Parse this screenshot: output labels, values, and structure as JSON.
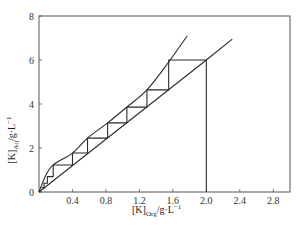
{
  "chart_data": {
    "type": "line",
    "title": "",
    "xlabel": "[K]Org/g·L⁻¹",
    "ylabel": "[K]Aq/g·L⁻¹",
    "xlabel_parts": {
      "main": "[K]",
      "sub": "Org",
      "unit": "/g·L",
      "sup": "−1"
    },
    "ylabel_parts": {
      "main": "[K]",
      "sub": "Aq",
      "unit": "/g·L",
      "sup": "−1"
    },
    "xlim": [
      0,
      3.0
    ],
    "ylim": [
      0,
      8
    ],
    "x_ticks": [
      0.4,
      0.8,
      1.2,
      1.6,
      2.0,
      2.4,
      2.8
    ],
    "x_tick_labels": [
      "0.4",
      "0.8",
      "1.2",
      "1.6",
      "2.0",
      "2.4",
      "2.8"
    ],
    "y_ticks": [
      0,
      2,
      4,
      6,
      8
    ],
    "y_tick_labels": [
      "0",
      "2",
      "4",
      "6",
      "8"
    ],
    "grid": false,
    "legend": null,
    "series": [
      {
        "name": "equilibrium-curve",
        "style": "curve",
        "x": [
          0.0,
          0.08,
          0.17,
          0.4,
          0.58,
          0.82,
          1.05,
          1.29,
          1.55,
          1.77
        ],
        "y": [
          0.0,
          0.75,
          1.23,
          1.77,
          2.45,
          3.14,
          3.86,
          4.64,
          5.91,
          7.09
        ]
      },
      {
        "name": "operating-line",
        "style": "straight",
        "x": [
          0.0,
          2.0,
          2.31
        ],
        "y": [
          0.0,
          6.0,
          6.95
        ]
      },
      {
        "name": "mccabe-thiele-steps",
        "style": "staircase",
        "x": [
          2.0,
          1.55,
          1.55,
          1.29,
          1.29,
          1.05,
          1.05,
          0.82,
          0.82,
          0.58,
          0.58,
          0.4,
          0.4,
          0.17,
          0.17,
          0.1,
          0.1,
          0.06,
          0.06,
          0.03
        ],
        "y": [
          6.0,
          6.0,
          4.64,
          4.64,
          3.86,
          3.86,
          3.14,
          3.14,
          2.45,
          2.45,
          1.77,
          1.77,
          1.23,
          1.23,
          0.7,
          0.7,
          0.4,
          0.4,
          0.2,
          0.2
        ]
      },
      {
        "name": "feed-drop-line",
        "style": "vertical",
        "x": [
          2.0,
          2.0
        ],
        "y": [
          6.0,
          0.0
        ]
      }
    ]
  }
}
